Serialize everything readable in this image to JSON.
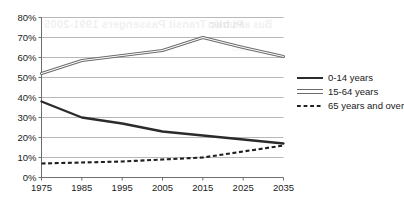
{
  "chart_data": {
    "type": "line",
    "title": "",
    "xlabel": "",
    "ylabel": "",
    "categories": [
      "1975",
      "1985",
      "1995",
      "2005",
      "2015",
      "2025",
      "2035"
    ],
    "x": [
      1975,
      1985,
      1995,
      2005,
      2015,
      2025,
      2035
    ],
    "xlim": [
      1975,
      2035
    ],
    "ylim": [
      0,
      80
    ],
    "y_tick_labels": [
      "0%",
      "10%",
      "20%",
      "30%",
      "40%",
      "50%",
      "60%",
      "70%",
      "80%"
    ],
    "y_tick_values": [
      0,
      10,
      20,
      30,
      40,
      50,
      60,
      70,
      80
    ],
    "grid": true,
    "legend_position": "right",
    "series": [
      {
        "name": "0-14 years",
        "style": "solid",
        "color": "#2b2b2b",
        "values": [
          38,
          30,
          27,
          23,
          21,
          19,
          17
        ]
      },
      {
        "name": "15-64 years",
        "style": "double",
        "color": "#6b6b6b",
        "values": [
          52,
          58.5,
          61,
          63.5,
          70,
          65,
          60.5
        ]
      },
      {
        "name": "65 years and over",
        "style": "dashed",
        "color": "#1f1f1f",
        "values": [
          7,
          7.5,
          8,
          9,
          10,
          13,
          16
        ]
      }
    ]
  },
  "legend": {
    "items": [
      {
        "label": "0-14 years"
      },
      {
        "label": "15-64 years"
      },
      {
        "label": "65 years and over"
      }
    ]
  },
  "ghost_text": {
    "title": "Public Transit Passengers 1991-2005",
    "subtitle": "Bus and train",
    "small": "2005"
  }
}
